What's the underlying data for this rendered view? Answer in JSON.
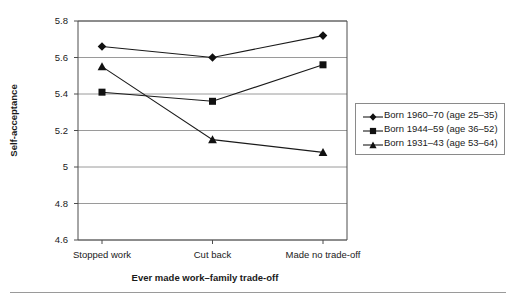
{
  "chart_data": {
    "type": "line",
    "title": "",
    "subtitle": "",
    "xlabel": "Ever made work–family trade-off",
    "ylabel": "Self-acceptance",
    "categories": [
      "Stopped work",
      "Cut back",
      "Made no trade-off"
    ],
    "ylim": [
      4.6,
      5.8
    ],
    "yticks": [
      "4.6",
      "4.8",
      "5",
      "5.2",
      "5.4",
      "5.6",
      "5.8"
    ],
    "ytick_values": [
      4.6,
      4.8,
      5.0,
      5.2,
      5.4,
      5.6,
      5.8
    ],
    "grid": true,
    "grid_axis": "y",
    "legend_position": "right",
    "series": [
      {
        "name": "Born 1960–70 (age 25–35)",
        "marker": "diamond",
        "values": [
          5.66,
          5.6,
          5.72
        ]
      },
      {
        "name": "Born 1944–59 (age 36–52)",
        "marker": "square",
        "values": [
          5.41,
          5.36,
          5.56
        ]
      },
      {
        "name": "Born 1931–43 (age 53–64)",
        "marker": "triangle",
        "values": [
          5.55,
          5.15,
          5.08
        ]
      }
    ]
  },
  "colors": {
    "line": "#1a1a1a",
    "marker": "#111111",
    "grid": "#9a9a9a",
    "axis": "#4d4d4d",
    "legend_border": "#8a8a8a",
    "background": "#ffffff",
    "footer_rule": "#9a9a9a"
  },
  "legend": {
    "items": [
      {
        "label": "Born 1960–70 (age 25–35)",
        "marker": "diamond-marker-icon"
      },
      {
        "label": "Born 1944–59 (age 36–52)",
        "marker": "square-marker-icon"
      },
      {
        "label": "Born 1931–43 (age 53–64)",
        "marker": "triangle-marker-icon"
      }
    ]
  }
}
